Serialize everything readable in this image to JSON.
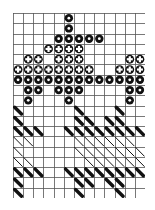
{
  "diagram": {
    "type": "knitting-chart",
    "cols": 13,
    "rows": 18,
    "colors": {
      "grid": "#555555",
      "ink": "#111111",
      "background": "#ffffff"
    },
    "symbols": {
      "B": "black-dot",
      "X": "cross-dot",
      "T": "thick-diagonal",
      "t": "thin-diagonal",
      ".": "empty"
    },
    "grid": [
      ".....B.......",
      ".....B.......",
      "....BBBBB....",
      "...XXXX......",
      ".XX.XXX....XX",
      "XXXXXXXX..XXX",
      "BBBBBBBBBBBBB",
      ".BB.BBB....BB",
      ".B...B.....B.",
      "T.....T...T..",
      "T.....TT.TT..",
      "TTT..TTTTTTTT",
      "tt....tttttt.",
      "t.....ttttttt",
      "tt.....tttttt",
      "TTT..TTTTTTTT",
      "T.....TT.TT..",
      "T.....T...T.."
    ]
  }
}
